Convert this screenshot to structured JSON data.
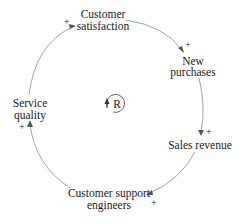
{
  "diagram": {
    "type": "causal-loop",
    "loop": {
      "label": "R",
      "meaning": "reinforcing"
    },
    "nodes": [
      {
        "id": "customer_satisfaction",
        "lines": [
          "Customer",
          "satisfaction"
        ]
      },
      {
        "id": "new_purchases",
        "lines": [
          "New",
          "purchases"
        ]
      },
      {
        "id": "sales_revenue",
        "lines": [
          "Sales revenue"
        ]
      },
      {
        "id": "customer_support_engineers",
        "lines": [
          "Customer support",
          "engineers"
        ]
      },
      {
        "id": "service_quality",
        "lines": [
          "Service",
          "quality"
        ]
      }
    ],
    "links": [
      {
        "from": "customer_satisfaction",
        "to": "new_purchases",
        "polarity": "+"
      },
      {
        "from": "new_purchases",
        "to": "sales_revenue",
        "polarity": "+"
      },
      {
        "from": "sales_revenue",
        "to": "customer_support_engineers",
        "polarity": "+"
      },
      {
        "from": "customer_support_engineers",
        "to": "service_quality",
        "polarity": "+"
      },
      {
        "from": "service_quality",
        "to": "customer_satisfaction",
        "polarity": "+"
      }
    ]
  }
}
